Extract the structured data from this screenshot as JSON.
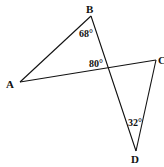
{
  "diagram": {
    "points": {
      "A": {
        "label": "A",
        "x": 20,
        "y": 82
      },
      "B": {
        "label": "B",
        "x": 91,
        "y": 16
      },
      "C": {
        "label": "C",
        "x": 156,
        "y": 60
      },
      "D": {
        "label": "D",
        "x": 136,
        "y": 151
      }
    },
    "segments": [
      "AB",
      "BD",
      "AC",
      "CD"
    ],
    "angles": {
      "at_B": "68°",
      "at_intersection": "80°",
      "at_D": "32°"
    },
    "line_color": "#111111"
  }
}
